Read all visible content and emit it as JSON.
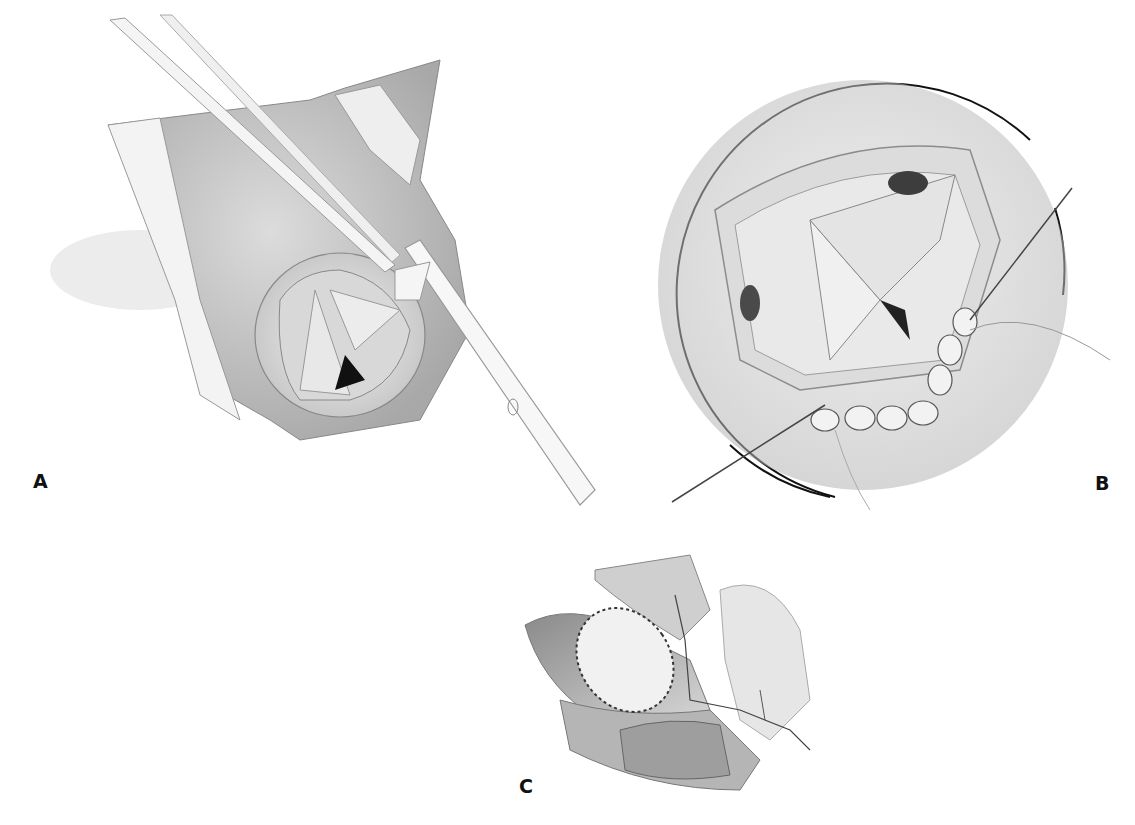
{
  "figure": {
    "panels": [
      {
        "id": "A",
        "label": "A",
        "description": "Aortic root opened with instrument and cannula inserted through valve"
      },
      {
        "id": "B",
        "label": "B",
        "description": "Circular magnified view of valve annulus with pledgeted sutures and needle"
      },
      {
        "id": "C",
        "label": "C",
        "description": "Closed patch suture line on vessel"
      }
    ],
    "colors": {
      "background": "#ffffff",
      "ink": "#111111",
      "tissue_light": "#e6e6e6",
      "tissue_mid": "#bdbdbd",
      "tissue_dark": "#7a7a7a",
      "shadow": "#1a1a1a"
    }
  }
}
